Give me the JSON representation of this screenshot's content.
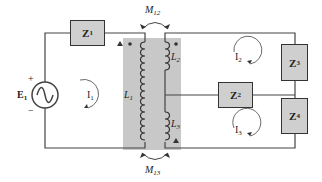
{
  "diagram": {
    "type": "circuit",
    "source": {
      "label": "E",
      "subscript": "1",
      "plus": "+",
      "minus": "−",
      "symbol": "sine-wave"
    },
    "impedances": [
      {
        "id": "Z1",
        "label": "Z",
        "subscript": "1"
      },
      {
        "id": "Z2",
        "label": "Z",
        "subscript": "2"
      },
      {
        "id": "Z3",
        "label": "Z",
        "subscript": "3"
      },
      {
        "id": "Z4",
        "label": "Z",
        "subscript": "4"
      }
    ],
    "inductors": [
      {
        "id": "L1",
        "label": "L",
        "subscript": "1"
      },
      {
        "id": "L2",
        "label": "L",
        "subscript": "2"
      },
      {
        "id": "L3",
        "label": "L",
        "subscript": "3"
      }
    ],
    "mutual": [
      {
        "id": "M12",
        "label": "M",
        "subscript": "12"
      },
      {
        "id": "M13",
        "label": "M",
        "subscript": "13"
      }
    ],
    "loop_currents": [
      {
        "id": "I1",
        "label": "I",
        "subscript": "1"
      },
      {
        "id": "I2",
        "label": "I",
        "subscript": "2"
      },
      {
        "id": "I3",
        "label": "I",
        "subscript": "3"
      }
    ],
    "polarity_marks": [
      "triangle",
      "dot",
      "dot",
      "triangle"
    ],
    "colors": {
      "core": "#c8c8c8",
      "box": "#cfcfcf",
      "wire": "#444444"
    }
  }
}
